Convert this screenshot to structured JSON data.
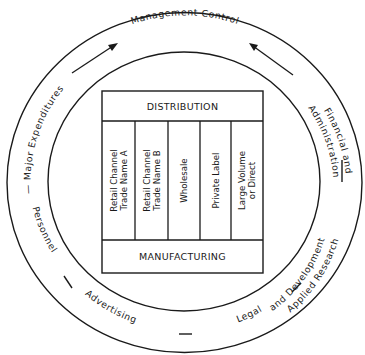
{
  "diagram": {
    "outer_ring": {
      "top_label": "Management Control",
      "left_upper_label": "— Major Expenditures",
      "left_lower_label": "Personnel",
      "bottom_left_label": "Advertising",
      "bottom_right_label": "Legal",
      "right_upper_label_line1": "Financial and",
      "right_upper_label_line2": "Administration",
      "right_lower_label_line1": "Applied Research",
      "right_lower_label_line2": "and Development"
    },
    "inner_box": {
      "top_header": "DISTRIBUTION",
      "bottom_footer": "MANUFACTURING",
      "columns": [
        {
          "line1": "Retail Channel",
          "line2": "Trade Name A"
        },
        {
          "line1": "Retail Channel",
          "line2": "Trade Name B"
        },
        {
          "line1": "Wholesale",
          "line2": ""
        },
        {
          "line1": "Private Label",
          "line2": ""
        },
        {
          "line1": "Large Volume",
          "line2": "or Direct"
        }
      ]
    }
  }
}
